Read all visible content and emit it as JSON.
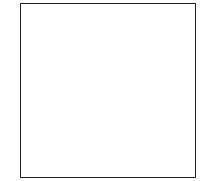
{
  "chart": {
    "columns": 14,
    "rows": 14,
    "dot_color": "#111111",
    "grid_color": "#333333",
    "row_patterns": {
      "14": [
        2,
        4,
        6,
        8,
        10,
        12,
        14
      ],
      "13": [],
      "12": [
        1,
        3,
        5,
        7,
        9,
        11,
        13
      ],
      "11": [
        1,
        3,
        5,
        7,
        9,
        11,
        13
      ],
      "10": [
        2,
        4,
        6,
        8,
        10,
        12,
        14
      ],
      "9": [
        2,
        4,
        6,
        8,
        10,
        12,
        14
      ],
      "8": [
        1,
        3,
        5,
        7,
        9,
        11,
        13
      ],
      "7": [
        1,
        3,
        5,
        7,
        9,
        11,
        13
      ],
      "6": [
        2,
        4,
        6,
        8,
        10,
        12,
        14
      ],
      "5": [
        2,
        4,
        6,
        8,
        10,
        12,
        14
      ],
      "4": [
        1,
        3,
        5,
        7,
        9,
        11,
        13
      ],
      "3": [
        1,
        3,
        5,
        7,
        9,
        11,
        13
      ],
      "2": [],
      "1": [
        2,
        4,
        6,
        8,
        10,
        12,
        14
      ]
    }
  },
  "labels": {
    "left": [
      "14",
      "12",
      "10",
      "8",
      "6",
      "4",
      "2"
    ],
    "right": [
      "13",
      "11",
      "9",
      "7",
      "5",
      "3",
      "1"
    ]
  }
}
